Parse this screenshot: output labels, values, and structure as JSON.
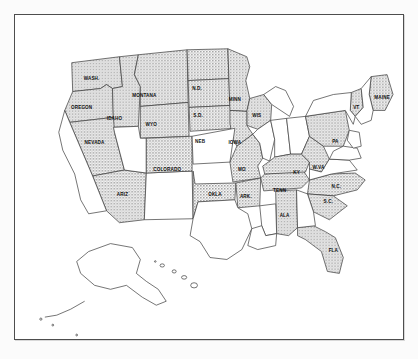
{
  "figure": {
    "frame_color": "#4d4d4d",
    "background_color": "#ffffff",
    "shaded_fill": "#b8b8b8",
    "unshaded_fill": "#ffffff",
    "outline_color": "#3a3a3a",
    "label_color": "#101010"
  },
  "map": {
    "shaded_states": [
      {
        "code": "WASH.",
        "label": "WASH.",
        "x": 77,
        "y": 63,
        "size": "sm"
      },
      {
        "code": "OREGON",
        "label": "OREGON",
        "x": 67,
        "y": 93,
        "size": "sm"
      },
      {
        "code": "IDAHO",
        "label": "IDAHO",
        "x": 100,
        "y": 104,
        "size": "sm"
      },
      {
        "code": "MONTANA",
        "label": "MONTANA",
        "x": 130,
        "y": 80,
        "size": "sm"
      },
      {
        "code": "WYO",
        "label": "WYO",
        "x": 137,
        "y": 110,
        "size": "sm"
      },
      {
        "code": "NEVADA",
        "label": "NEVADA",
        "x": 80,
        "y": 128,
        "size": "sm"
      },
      {
        "code": "N.D.",
        "label": "N.D.",
        "x": 183,
        "y": 73,
        "size": "sm"
      },
      {
        "code": "S.D.",
        "label": "S.D.",
        "x": 184,
        "y": 101,
        "size": "sm"
      },
      {
        "code": "NEB",
        "label": "NEB",
        "x": 186,
        "y": 127,
        "size": "sm"
      },
      {
        "code": "MINN",
        "label": "MINN",
        "x": 221,
        "y": 85,
        "size": "sm"
      },
      {
        "code": "WIS",
        "label": "WIS",
        "x": 243,
        "y": 101,
        "size": "sm"
      },
      {
        "code": "IOWA",
        "label": "IOWA",
        "x": 221,
        "y": 128,
        "size": "sm"
      },
      {
        "code": "COLORADO",
        "label": "COLORADO",
        "x": 153,
        "y": 155,
        "size": "sm"
      },
      {
        "code": "ARIZ",
        "label": "ARIZ",
        "x": 108,
        "y": 180,
        "size": "sm"
      },
      {
        "code": "MO",
        "label": "MO",
        "x": 228,
        "y": 155,
        "size": "sm"
      },
      {
        "code": "OKLA",
        "label": "OKLA",
        "x": 201,
        "y": 180,
        "size": "sm"
      },
      {
        "code": "ARK.",
        "label": "ARK.",
        "x": 232,
        "y": 182,
        "size": "sm"
      },
      {
        "code": "TENN",
        "label": "TENN",
        "x": 266,
        "y": 176,
        "size": "sm"
      },
      {
        "code": "KY",
        "label": "KY",
        "x": 283,
        "y": 158,
        "size": "sm"
      },
      {
        "code": "ALA",
        "label": "ALA",
        "x": 271,
        "y": 201,
        "size": "sm"
      },
      {
        "code": "W.VA",
        "label": "W.VA",
        "x": 305,
        "y": 153,
        "size": "sm"
      },
      {
        "code": "PA",
        "label": "PA",
        "x": 322,
        "y": 127,
        "size": "sm"
      },
      {
        "code": "VT",
        "label": "VT",
        "x": 343,
        "y": 93,
        "size": "sm"
      },
      {
        "code": "MAINE",
        "label": "MAINE",
        "x": 369,
        "y": 83,
        "size": "sm"
      },
      {
        "code": "N.C.",
        "label": "N.C.",
        "x": 323,
        "y": 172,
        "size": "sm"
      },
      {
        "code": "S.C.",
        "label": "S.C.",
        "x": 315,
        "y": 187,
        "size": "sm"
      },
      {
        "code": "FLA",
        "label": "FLA",
        "x": 320,
        "y": 236,
        "size": "sm"
      }
    ],
    "unshaded_states": [
      "California",
      "Utah",
      "New Mexico",
      "Kansas",
      "Texas",
      "Illinois",
      "Indiana",
      "Ohio",
      "Michigan",
      "Mississippi",
      "Louisiana",
      "Georgia",
      "Virginia",
      "Maryland",
      "Delaware",
      "New Jersey",
      "New York",
      "Connecticut",
      "Rhode Island",
      "Massachusetts",
      "New Hampshire",
      "Alaska",
      "Hawaii"
    ],
    "inset_regions": [
      "Alaska",
      "Hawaii"
    ]
  }
}
